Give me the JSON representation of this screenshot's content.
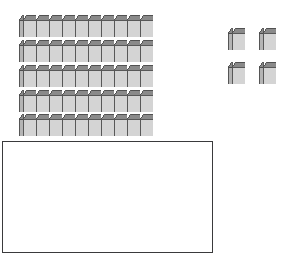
{
  "scene": {
    "title": "Base Ten Blocks",
    "description": "Five rods of ten unit cubes and four loose unit cubes above an empty answer box.",
    "background_color": "#ffffff"
  },
  "blocks": {
    "rod_label": "ten-rod",
    "unit_label": "unit-cube",
    "cubes_per_rod": 10,
    "rod_count": 5,
    "loose_unit_count": 4,
    "total_value": 54,
    "tens_value": 50,
    "ones_value": 4,
    "rods": [
      {
        "id": "rod-1",
        "x": 19,
        "y": 15,
        "cubes": 10
      },
      {
        "id": "rod-2",
        "x": 19,
        "y": 40,
        "cubes": 10
      },
      {
        "id": "rod-3",
        "x": 19,
        "y": 65,
        "cubes": 10
      },
      {
        "id": "rod-4",
        "x": 19,
        "y": 90,
        "cubes": 10
      },
      {
        "id": "rod-5",
        "x": 19,
        "y": 114,
        "cubes": 10
      }
    ],
    "loose_units": [
      {
        "id": "unit-1",
        "x": 228,
        "y": 28
      },
      {
        "id": "unit-2",
        "x": 259,
        "y": 28
      },
      {
        "id": "unit-3",
        "x": 228,
        "y": 62
      },
      {
        "id": "unit-4",
        "x": 259,
        "y": 62
      }
    ],
    "geometry": {
      "cube_width": 17,
      "cube_height": 22,
      "face_width": 13,
      "face_height": 17,
      "depth_x": 4,
      "depth_y": 5
    },
    "colors": {
      "front_face": "#d4d4d4",
      "top_face": "#8a8a8a",
      "side_face": "#b4b4b4",
      "outline": "#4a4a4a",
      "inner_line": "#6e6e6e"
    }
  },
  "answer_box": {
    "name": "answer-box",
    "value": "",
    "placeholder": "",
    "border_color": "#3a3a3c",
    "x": 2,
    "y": 141,
    "width": 211,
    "height": 112
  }
}
